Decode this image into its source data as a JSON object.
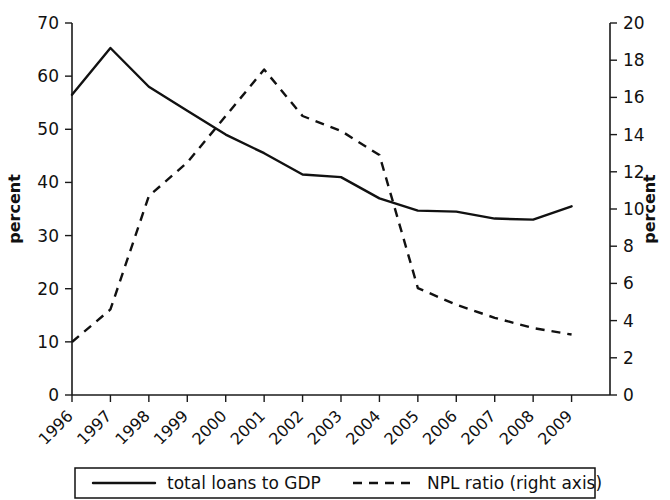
{
  "chart_data": {
    "type": "line",
    "title": "",
    "xlabel": "",
    "ylabel": "percent",
    "y2label": "percent",
    "grid": false,
    "legend_position": "bottom",
    "categories": [
      "1996",
      "1997",
      "1998",
      "1999",
      "2000",
      "2001",
      "2002",
      "2003",
      "2004",
      "2005",
      "2006",
      "2007",
      "2008",
      "2009"
    ],
    "ylim": [
      0,
      70
    ],
    "y2lim": [
      0,
      20
    ],
    "yticks": [
      0,
      10,
      20,
      30,
      40,
      50,
      60,
      70
    ],
    "y2ticks": [
      0,
      2,
      4,
      6,
      8,
      10,
      12,
      14,
      16,
      18,
      20
    ],
    "series": [
      {
        "name": "total loans to GDP",
        "axis": "left",
        "style": "solid",
        "values": [
          56.5,
          65.3,
          58.0,
          53.5,
          49.0,
          45.5,
          41.5,
          41.0,
          37.0,
          34.7,
          34.5,
          33.2,
          33.0,
          35.5
        ]
      },
      {
        "name": "NPL ratio (right axis)",
        "axis": "right",
        "style": "dashed",
        "values": [
          2.85,
          4.6,
          10.7,
          12.5,
          15.0,
          17.5,
          15.0,
          14.2,
          12.9,
          5.75,
          4.85,
          4.15,
          3.6,
          3.25
        ]
      }
    ]
  },
  "axes": {
    "left_title": "percent",
    "right_title": "percent"
  },
  "legend": {
    "items": [
      {
        "label": "total loans to GDP",
        "style": "solid"
      },
      {
        "label": "NPL ratio (right axis)",
        "style": "dashed"
      }
    ]
  },
  "colors": {
    "ink": "#111111",
    "background": "#ffffff"
  }
}
